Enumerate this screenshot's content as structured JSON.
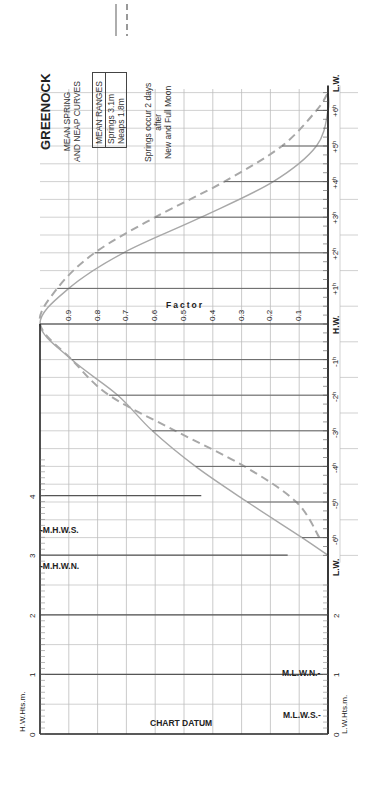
{
  "title": "GREENOCK",
  "subtitle": [
    "MEAN SPRING",
    "AND NEAP CURVES"
  ],
  "mean_ranges": {
    "header": "MEAN RANGES",
    "springs": "Springs 3.1m",
    "neaps": "Neaps  1.8m"
  },
  "note": [
    "Springs occur 2 days",
    "after",
    "New and Full Moon"
  ],
  "axes": {
    "factor_label": "Factor",
    "hw_heights_label": "H.W.Hts.m.",
    "lw_heights_label": "L.W.Hts.m.",
    "chart_datum_label": "CHART DATUM",
    "time_labels": [
      "L.W.",
      "-6ʰ",
      "-5ʰ",
      "-4ʰ",
      "-3ʰ",
      "-2ʰ",
      "-1ʰ",
      "H.W.",
      "+1ʰ",
      "+2ʰ",
      "+3ʰ",
      "+4ʰ",
      "+5ʰ",
      "+6ʰ",
      "L.W."
    ],
    "factor_ticks": [
      "0.9",
      "0.8",
      "0.7",
      "0.6",
      "0.5",
      "0.4",
      "0.3",
      "0.2",
      "0.1"
    ],
    "hw_height_ticks": [
      "0",
      "1",
      "2",
      "3",
      "4"
    ],
    "lw_height_ticks": [
      "0",
      "1",
      "2"
    ]
  },
  "levels": {
    "mhws": {
      "label": "-M.H.W.S.",
      "value": 3.4
    },
    "mhwn": {
      "label": "-M.H.W.N.",
      "value": 2.9
    },
    "mlwn": {
      "label": "M.L.W.N.-",
      "value": 1.0
    },
    "mlws": {
      "label": "M.L.W.S.-",
      "value": 0.3
    }
  },
  "legend": {
    "springs_style": "solid",
    "neaps_style": "dashed"
  },
  "colors": {
    "curve": "#a8a8a8",
    "grid": "#bdbdbd",
    "axis": "#222222",
    "text": "#222222"
  },
  "chart_data": {
    "type": "line",
    "xlabel": "Time relative to H.W. (hours)",
    "ylabel": "Factor",
    "x": [
      -6.5,
      -6,
      -5,
      -4,
      -3,
      -2,
      -1,
      0,
      1,
      2,
      3,
      4,
      5,
      6,
      6.5
    ],
    "series": [
      {
        "name": "Springs (3.1m)",
        "style": "solid",
        "values": [
          0.0,
          0.09,
          0.28,
          0.46,
          0.61,
          0.73,
          0.89,
          1.0,
          0.9,
          0.71,
          0.44,
          0.19,
          0.04,
          0.0,
          0.0
        ]
      },
      {
        "name": "Neaps (1.8m)",
        "style": "dashed",
        "values": [
          null,
          0.03,
          0.11,
          0.29,
          0.53,
          0.76,
          0.89,
          1.0,
          0.94,
          0.81,
          0.6,
          0.36,
          0.16,
          0.04,
          0.0
        ]
      }
    ],
    "ylim": [
      0,
      1
    ],
    "grid": true
  }
}
